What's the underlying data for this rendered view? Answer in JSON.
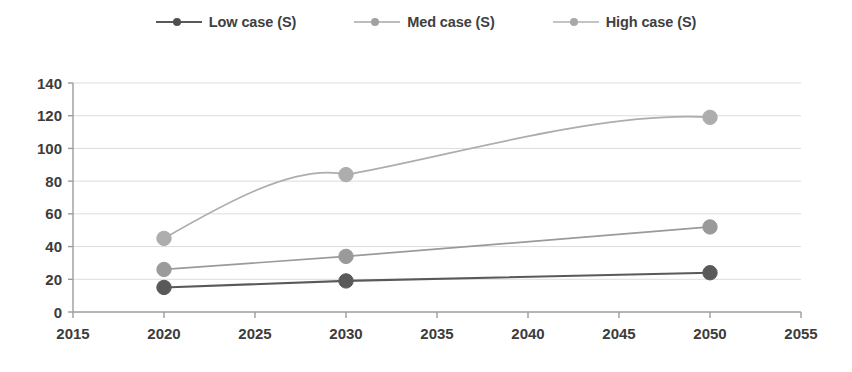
{
  "chart_data": {
    "type": "line",
    "title": "",
    "subtitle": "",
    "xlabel": "",
    "ylabel": "",
    "x": [
      2020,
      2030,
      2050
    ],
    "xlim": [
      2015,
      2055
    ],
    "ylim": [
      0,
      140
    ],
    "xticks": [
      2015,
      2020,
      2025,
      2030,
      2035,
      2040,
      2045,
      2050,
      2055
    ],
    "yticks": [
      0,
      20,
      40,
      60,
      80,
      100,
      120,
      140
    ],
    "grid": true,
    "grid_axis": "y",
    "legend_position": "top-center",
    "markers": "circle",
    "series": [
      {
        "name": "Low case (S)",
        "values": [
          15,
          19,
          24
        ],
        "color": "#595959"
      },
      {
        "name": "Med case (S)",
        "values": [
          26,
          34,
          52
        ],
        "color": "#9a9a9a"
      },
      {
        "name": "High case (S)",
        "values": [
          45,
          84,
          119
        ],
        "color": "#adadad"
      }
    ]
  },
  "legend": {
    "items": [
      {
        "label": "Low case (S)"
      },
      {
        "label": "Med case (S)"
      },
      {
        "label": "High case (S)"
      }
    ]
  },
  "axes": {
    "y_tick_labels": [
      "140",
      "120",
      "100",
      "80",
      "60",
      "40",
      "20",
      "0"
    ],
    "x_tick_labels": [
      "2015",
      "2020",
      "2025",
      "2030",
      "2035",
      "2040",
      "2045",
      "2050",
      "2055"
    ]
  },
  "colors": {
    "low": "#595959",
    "med": "#9a9a9a",
    "high": "#adadad",
    "axis": "#9c9c9c",
    "grid": "#dcdcdc",
    "text": "#3c3c3c",
    "background": "#ffffff"
  }
}
